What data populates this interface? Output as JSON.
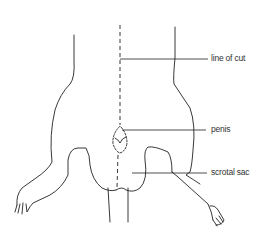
{
  "diagram": {
    "labels": {
      "line_of_cut": "line of cut",
      "penis": "penis",
      "scrotal_sac": "scrotal sac"
    },
    "colors": {
      "stroke": "#222222",
      "background": "#ffffff",
      "text": "#333333"
    }
  }
}
